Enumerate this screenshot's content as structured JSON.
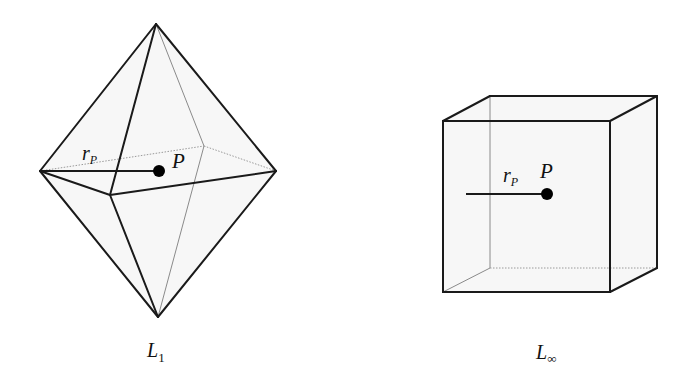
{
  "figure": {
    "panels": [
      {
        "id": "octahedron",
        "caption_main": "L",
        "caption_sub": "1",
        "radius_label_main": "r",
        "radius_label_sub": "P",
        "point_label": "P",
        "shape": "octahedron"
      },
      {
        "id": "cube",
        "caption_main": "L",
        "caption_sub": "∞",
        "radius_label_main": "r",
        "radius_label_sub": "P",
        "point_label": "P",
        "shape": "cube"
      }
    ]
  },
  "colors": {
    "visible_edge": "#1a1a1a",
    "hidden_edge": "#8a8a8a",
    "face_fill": "#f7f7f7",
    "point": "#000000",
    "background": "#ffffff"
  }
}
